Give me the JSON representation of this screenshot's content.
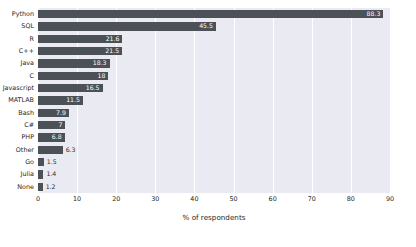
{
  "chart_data": {
    "type": "bar",
    "orientation": "horizontal",
    "title": "",
    "xlabel": "% of respondents",
    "ylabel": "",
    "xlim": [
      0,
      90
    ],
    "xticks": [
      0,
      10,
      20,
      30,
      40,
      50,
      60,
      70,
      80,
      90
    ],
    "grid": true,
    "legend": null,
    "bar_color": "#4c5158",
    "plot_background": "#eaeaf2",
    "categories": [
      "Python",
      "SQL",
      "R",
      "C++",
      "Java",
      "C",
      "Javascript",
      "MATLAB",
      "Bash",
      "C#",
      "PHP",
      "Other",
      "Go",
      "Julia",
      "None"
    ],
    "values": [
      88.3,
      45.5,
      21.6,
      21.5,
      18.3,
      18,
      16.5,
      11.5,
      7.9,
      7,
      6.8,
      6.3,
      1.5,
      1.4,
      1.2
    ],
    "value_labels": [
      "88.3",
      "45.5",
      "21.6",
      "21.5",
      "18.3",
      "18",
      "16.5",
      "11.5",
      "7.9",
      "7",
      "6.8",
      "6.3",
      "1.5",
      "1.4",
      "1.2"
    ]
  }
}
